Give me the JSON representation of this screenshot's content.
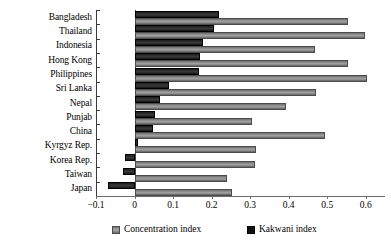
{
  "chart_data": {
    "type": "bar",
    "orientation": "horizontal",
    "title": "",
    "xlabel": "",
    "ylabel": "",
    "xlim": [
      -0.1,
      0.65
    ],
    "grid": false,
    "legend_position": "bottom",
    "xticks": [
      -0.1,
      0,
      0.1,
      0.2,
      0.3,
      0.4,
      0.5,
      0.6
    ],
    "xtick_labels": [
      "-0.1",
      "0",
      "0.1",
      "0.2",
      "0.3",
      "0.4",
      "0.5",
      "0.6"
    ],
    "categories": [
      "Bangladesh",
      "Thailand",
      "Indonesia",
      "Hong Kong",
      "Philippines",
      "Sri Lanka",
      "Nepal",
      "Punjab",
      "China",
      "Kyrgyz Rep.",
      "Korea Rep.",
      "Taiwan",
      "Japan"
    ],
    "series": [
      {
        "name": "Concentration index",
        "color": "#8c8c8c",
        "values": [
          0.555,
          0.597,
          0.469,
          0.555,
          0.603,
          0.471,
          0.392,
          0.304,
          0.495,
          0.316,
          0.313,
          0.239,
          0.254
        ]
      },
      {
        "name": "Kakwani index",
        "color": "#111111",
        "values": [
          0.218,
          0.205,
          0.177,
          0.17,
          0.168,
          0.089,
          0.065,
          0.053,
          0.048,
          0.01,
          -0.024,
          -0.031,
          -0.069
        ]
      }
    ]
  },
  "legend": {
    "items": [
      {
        "label": "Concentration index",
        "swatch": "conc"
      },
      {
        "label": "Kakwani index",
        "swatch": "kak"
      }
    ]
  }
}
